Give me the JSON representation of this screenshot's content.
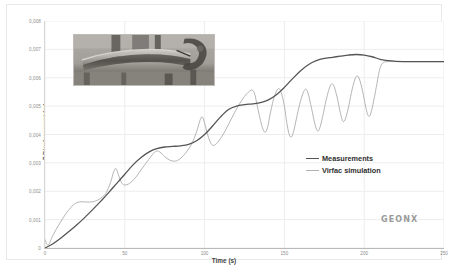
{
  "chart_data": {
    "type": "line",
    "title": "",
    "xlabel": "Time (s)",
    "ylabel": "Z Displacement (m)",
    "xlim": [
      0,
      250
    ],
    "ylim": [
      0,
      0.008
    ],
    "grid": true,
    "legend_position": "inside-right",
    "xticks": [
      "0",
      "50",
      "100",
      "150",
      "200",
      "250"
    ],
    "xtick_values": [
      0,
      50,
      100,
      150,
      200,
      250
    ],
    "yticks": [
      "0",
      "0,001",
      "0,002",
      "0,003",
      "0,004",
      "0,005",
      "0,006",
      "0,007",
      "0,008"
    ],
    "ytick_values": [
      0,
      0.001,
      0.002,
      0.003,
      0.004,
      0.005,
      0.006,
      0.007,
      0.008
    ],
    "series": [
      {
        "name": "Measurements",
        "color": "#555555",
        "width": 1.3,
        "points": [
          [
            0,
            0.0
          ],
          [
            5,
            0.00015
          ],
          [
            10,
            0.00035
          ],
          [
            15,
            0.00058
          ],
          [
            20,
            0.00082
          ],
          [
            25,
            0.00108
          ],
          [
            30,
            0.00136
          ],
          [
            35,
            0.00165
          ],
          [
            40,
            0.00196
          ],
          [
            45,
            0.00228
          ],
          [
            50,
            0.0026
          ],
          [
            55,
            0.00292
          ],
          [
            60,
            0.00318
          ],
          [
            65,
            0.00338
          ],
          [
            70,
            0.0035
          ],
          [
            75,
            0.00356
          ],
          [
            80,
            0.00358
          ],
          [
            85,
            0.0036
          ],
          [
            90,
            0.00365
          ],
          [
            95,
            0.00378
          ],
          [
            100,
            0.004
          ],
          [
            105,
            0.0043
          ],
          [
            110,
            0.00462
          ],
          [
            115,
            0.00488
          ],
          [
            120,
            0.005
          ],
          [
            125,
            0.00505
          ],
          [
            130,
            0.00508
          ],
          [
            135,
            0.00512
          ],
          [
            140,
            0.00522
          ],
          [
            145,
            0.0054
          ],
          [
            150,
            0.00566
          ],
          [
            155,
            0.00596
          ],
          [
            160,
            0.00624
          ],
          [
            165,
            0.00646
          ],
          [
            170,
            0.0066
          ],
          [
            175,
            0.00668
          ],
          [
            180,
            0.00672
          ],
          [
            185,
            0.00676
          ],
          [
            190,
            0.0068
          ],
          [
            195,
            0.00682
          ],
          [
            200,
            0.0068
          ],
          [
            205,
            0.00674
          ],
          [
            210,
            0.00665
          ],
          [
            215,
            0.0066
          ],
          [
            220,
            0.00658
          ],
          [
            230,
            0.00657
          ],
          [
            240,
            0.00657
          ],
          [
            250,
            0.00657
          ]
        ]
      },
      {
        "name": "Virfac simulation",
        "color": "#a8a8a8",
        "width": 0.85,
        "points": [
          [
            0,
            0.0003
          ],
          [
            2,
            0.0001
          ],
          [
            5,
            0.00045
          ],
          [
            9,
            0.00085
          ],
          [
            13,
            0.0012
          ],
          [
            17,
            0.00148
          ],
          [
            20,
            0.0016
          ],
          [
            23,
            0.00163
          ],
          [
            26,
            0.00162
          ],
          [
            30,
            0.00163
          ],
          [
            34,
            0.00172
          ],
          [
            38,
            0.00192
          ],
          [
            41,
            0.0023
          ],
          [
            43,
            0.00268
          ],
          [
            44.5,
            0.0028
          ],
          [
            46,
            0.00258
          ],
          [
            48,
            0.0023
          ],
          [
            50,
            0.00222
          ],
          [
            53,
            0.00228
          ],
          [
            57,
            0.0025
          ],
          [
            61,
            0.00282
          ],
          [
            65,
            0.00312
          ],
          [
            68,
            0.00334
          ],
          [
            70,
            0.00342
          ],
          [
            72,
            0.00338
          ],
          [
            75,
            0.00322
          ],
          [
            78,
            0.0031
          ],
          [
            81,
            0.00306
          ],
          [
            84,
            0.00312
          ],
          [
            88,
            0.00334
          ],
          [
            92,
            0.00368
          ],
          [
            95,
            0.0041
          ],
          [
            97,
            0.00448
          ],
          [
            98.5,
            0.00462
          ],
          [
            100,
            0.0044
          ],
          [
            102,
            0.00398
          ],
          [
            104,
            0.00368
          ],
          [
            106,
            0.00362
          ],
          [
            109,
            0.00378
          ],
          [
            113,
            0.00414
          ],
          [
            117,
            0.00458
          ],
          [
            121,
            0.005
          ],
          [
            125,
            0.00534
          ],
          [
            128,
            0.00552
          ],
          [
            130,
            0.00556
          ],
          [
            131.5,
            0.0054
          ],
          [
            133,
            0.005
          ],
          [
            135,
            0.0045
          ],
          [
            136.5,
            0.0042
          ],
          [
            138,
            0.00408
          ],
          [
            139.5,
            0.00426
          ],
          [
            141,
            0.0047
          ],
          [
            143,
            0.0052
          ],
          [
            145,
            0.00552
          ],
          [
            146.5,
            0.00562
          ],
          [
            148,
            0.00548
          ],
          [
            150,
            0.005
          ],
          [
            151.5,
            0.00442
          ],
          [
            153,
            0.004
          ],
          [
            154.5,
            0.00392
          ],
          [
            156,
            0.00416
          ],
          [
            158,
            0.00468
          ],
          [
            160,
            0.00516
          ],
          [
            162,
            0.0055
          ],
          [
            163.5,
            0.0056
          ],
          [
            165,
            0.00542
          ],
          [
            167,
            0.00492
          ],
          [
            169,
            0.0044
          ],
          [
            170.5,
            0.00414
          ],
          [
            172,
            0.0042
          ],
          [
            174,
            0.00464
          ],
          [
            176,
            0.00518
          ],
          [
            178,
            0.0056
          ],
          [
            179.5,
            0.00578
          ],
          [
            181,
            0.00572
          ],
          [
            183,
            0.00532
          ],
          [
            185,
            0.00478
          ],
          [
            186.5,
            0.00448
          ],
          [
            188,
            0.00452
          ],
          [
            190,
            0.00492
          ],
          [
            192,
            0.00548
          ],
          [
            194,
            0.00592
          ],
          [
            195.5,
            0.00606
          ],
          [
            197,
            0.00596
          ],
          [
            199,
            0.00552
          ],
          [
            201,
            0.00496
          ],
          [
            202.5,
            0.00466
          ],
          [
            204,
            0.00472
          ],
          [
            206,
            0.0052
          ],
          [
            208,
            0.0058
          ],
          [
            209.5,
            0.00625
          ],
          [
            211,
            0.00648
          ],
          [
            213,
            0.00656
          ],
          [
            216,
            0.00657
          ],
          [
            220,
            0.00657
          ],
          [
            230,
            0.00657
          ],
          [
            240,
            0.00657
          ],
          [
            250,
            0.00657
          ]
        ]
      }
    ]
  },
  "legend": {
    "items": [
      {
        "label": "Measurements",
        "color": "#555555",
        "width": 1.4
      },
      {
        "label": "Virfac simulation",
        "color": "#b0b0b0",
        "width": 1.0
      }
    ]
  },
  "inset": {
    "name": "welded-beam-photo",
    "description": "Grayscale photograph of a welded metal beam clamped to a workbench"
  },
  "logo": {
    "text": "GEON",
    "accent": "X",
    "tick": "ˇ"
  }
}
